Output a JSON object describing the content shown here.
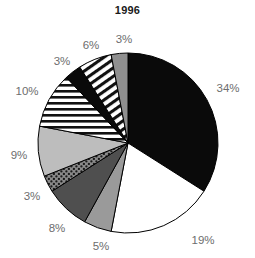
{
  "chart_data": {
    "type": "pie",
    "title": "1996",
    "xlabel": "",
    "ylabel": "",
    "legend": "none",
    "grid": false,
    "start_angle_deg": 0,
    "direction": "clockwise",
    "total": 100,
    "categories": [
      "segment-34",
      "segment-19",
      "segment-5",
      "segment-8",
      "segment-3-dotted",
      "segment-9",
      "segment-10",
      "segment-3-black",
      "segment-6",
      "segment-3-gray"
    ],
    "values": [
      34,
      19,
      5,
      8,
      3,
      9,
      10,
      3,
      6,
      3
    ],
    "labels": [
      "34%",
      "19%",
      "5%",
      "8%",
      "3%",
      "9%",
      "10%",
      "3%",
      "6%",
      "3%"
    ],
    "slices": [
      {
        "label": "34%",
        "value": 34,
        "fill": "solid-black",
        "color": "#0a0a0a",
        "label_x": 228,
        "label_y": 88
      },
      {
        "label": "19%",
        "value": 19,
        "fill": "solid-white",
        "color": "#ffffff",
        "label_x": 203,
        "label_y": 240
      },
      {
        "label": "5%",
        "value": 5,
        "fill": "solid-gray",
        "color": "#9a9a9a",
        "label_x": 101,
        "label_y": 246
      },
      {
        "label": "8%",
        "value": 8,
        "fill": "solid-darkgray",
        "color": "#4f4f4f",
        "label_x": 57,
        "label_y": 228
      },
      {
        "label": "3%",
        "value": 3,
        "fill": "dotted-gray",
        "color": "#8a8a8a",
        "label_x": 32,
        "label_y": 196
      },
      {
        "label": "9%",
        "value": 9,
        "fill": "solid-lightgray",
        "color": "#bdbdbd",
        "label_x": 19,
        "label_y": 155
      },
      {
        "label": "10%",
        "value": 10,
        "fill": "horizontal-stripes",
        "color": "#ffffff",
        "label_x": 27,
        "label_y": 91
      },
      {
        "label": "3%",
        "value": 3,
        "fill": "solid-black",
        "color": "#0a0a0a",
        "label_x": 62,
        "label_y": 61
      },
      {
        "label": "6%",
        "value": 6,
        "fill": "diagonal-stripes",
        "color": "#ffffff",
        "label_x": 91,
        "label_y": 45
      },
      {
        "label": "3%",
        "value": 3,
        "fill": "solid-midgray",
        "color": "#8f8f8f",
        "label_x": 124,
        "label_y": 39
      }
    ],
    "geometry": {
      "center_x": 128,
      "center_y": 143,
      "radius": 90
    },
    "colors": {
      "label_text": "#6d6d6d",
      "title_text": "#1a1a1a",
      "outline": "#000000",
      "background": "#ffffff"
    }
  }
}
